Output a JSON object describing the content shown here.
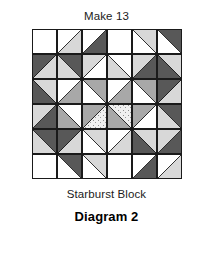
{
  "figure": {
    "top_label": "Make 13",
    "block_name": "Starburst Block",
    "diagram_label": "Diagram 2"
  },
  "palette": {
    "white": "#ffffff",
    "light": "#d8d8d8",
    "dotted": "#e6e6e6",
    "medium": "#a8a8a8",
    "dark": "#585858",
    "line": "#1a1a1a"
  },
  "chart_data": {
    "type": "table",
    "title": "Starburst Block",
    "grid": {
      "rows": 6,
      "cols": 6,
      "cell_px": 25
    },
    "fabrics": [
      "white",
      "light",
      "dotted",
      "medium",
      "dark"
    ],
    "legend": [
      {
        "name": "white",
        "color": "#ffffff"
      },
      {
        "name": "light",
        "color": "#d8d8d8"
      },
      {
        "name": "dotted",
        "color": "#e6e6e6"
      },
      {
        "name": "medium",
        "color": "#a8a8a8"
      },
      {
        "name": "dark",
        "color": "#585858"
      }
    ],
    "cells": [
      [
        {
          "unit": "solid",
          "a": "white"
        },
        {
          "unit": "hst",
          "dir": "tl-br",
          "a": "white",
          "b": "light"
        },
        {
          "unit": "hst",
          "dir": "tl-br",
          "a": "white",
          "b": "dark"
        },
        {
          "unit": "solid",
          "a": "white"
        },
        {
          "unit": "hst",
          "dir": "tr-bl",
          "a": "light",
          "b": "white"
        },
        {
          "unit": "hst",
          "dir": "tr-bl",
          "a": "dark",
          "b": "white"
        }
      ],
      [
        {
          "unit": "hst",
          "dir": "tl-br",
          "a": "dark",
          "b": "light"
        },
        {
          "unit": "hst",
          "dir": "tr-bl",
          "a": "dark",
          "b": "light"
        },
        {
          "unit": "hst",
          "dir": "tl-br",
          "a": "light",
          "b": "white"
        },
        {
          "unit": "hst",
          "dir": "tr-bl",
          "a": "white",
          "b": "light"
        },
        {
          "unit": "hst",
          "dir": "tl-br",
          "a": "light",
          "b": "dark"
        },
        {
          "unit": "hst",
          "dir": "tr-bl",
          "a": "light",
          "b": "dark"
        }
      ],
      [
        {
          "unit": "hst",
          "dir": "tr-bl",
          "a": "light",
          "b": "dark"
        },
        {
          "unit": "hst",
          "dir": "tl-br",
          "a": "white",
          "b": "medium"
        },
        {
          "unit": "hst",
          "dir": "tr-bl",
          "a": "medium",
          "b": "white"
        },
        {
          "unit": "hst",
          "dir": "tl-br",
          "a": "white",
          "b": "medium"
        },
        {
          "unit": "hst",
          "dir": "tr-bl",
          "a": "medium",
          "b": "white"
        },
        {
          "unit": "hst",
          "dir": "tl-br",
          "a": "dark",
          "b": "light"
        }
      ],
      [
        {
          "unit": "hst",
          "dir": "tl-br",
          "a": "light",
          "b": "dark"
        },
        {
          "unit": "hst",
          "dir": "tr-bl",
          "a": "white",
          "b": "medium"
        },
        {
          "unit": "hst",
          "dir": "tl-br",
          "a": "medium",
          "b": "dotted"
        },
        {
          "unit": "hst",
          "dir": "tr-bl",
          "a": "dotted",
          "b": "medium"
        },
        {
          "unit": "hst",
          "dir": "tl-br",
          "a": "medium",
          "b": "white"
        },
        {
          "unit": "hst",
          "dir": "tr-bl",
          "a": "dark",
          "b": "light"
        }
      ],
      [
        {
          "unit": "hst",
          "dir": "tr-bl",
          "a": "dark",
          "b": "light"
        },
        {
          "unit": "hst",
          "dir": "tl-br",
          "a": "dark",
          "b": "light"
        },
        {
          "unit": "hst",
          "dir": "tr-bl",
          "a": "light",
          "b": "white"
        },
        {
          "unit": "hst",
          "dir": "tl-br",
          "a": "white",
          "b": "light"
        },
        {
          "unit": "hst",
          "dir": "tr-bl",
          "a": "light",
          "b": "dark"
        },
        {
          "unit": "hst",
          "dir": "tl-br",
          "a": "light",
          "b": "dark"
        }
      ],
      [
        {
          "unit": "solid",
          "a": "white"
        },
        {
          "unit": "hst",
          "dir": "tr-bl",
          "a": "dark",
          "b": "white"
        },
        {
          "unit": "hst",
          "dir": "tr-bl",
          "a": "light",
          "b": "white"
        },
        {
          "unit": "solid",
          "a": "white"
        },
        {
          "unit": "hst",
          "dir": "tl-br",
          "a": "white",
          "b": "dark"
        },
        {
          "unit": "hst",
          "dir": "tl-br",
          "a": "white",
          "b": "light"
        }
      ]
    ]
  }
}
